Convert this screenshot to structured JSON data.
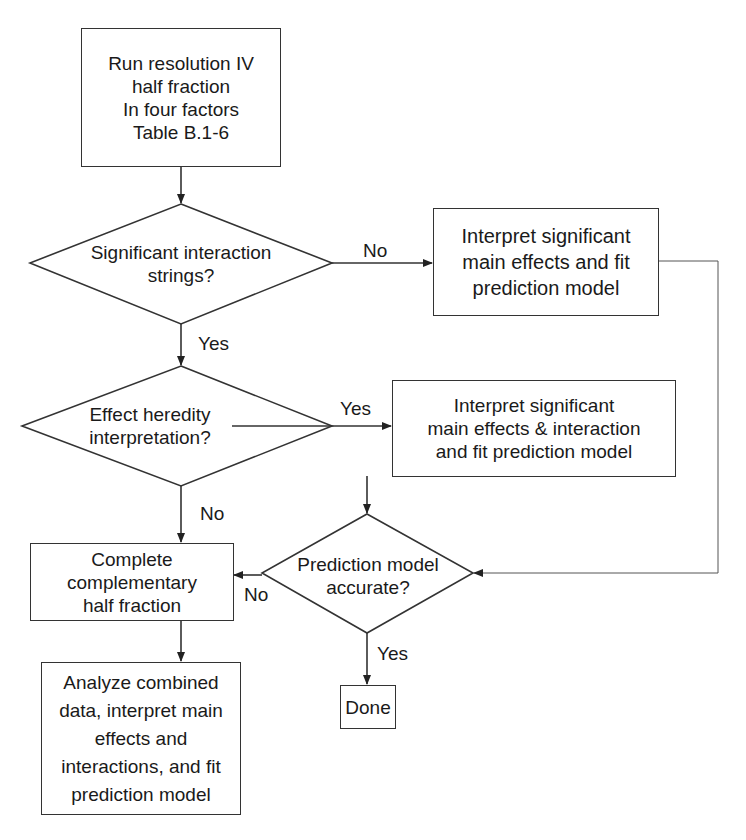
{
  "flowchart": {
    "nodes": {
      "start": {
        "type": "process",
        "text": "Run resolution IV\nhalf fraction\nIn four factors\nTable B.1-6"
      },
      "decision_interactions": {
        "type": "decision",
        "text": "Significant interaction\nstrings?"
      },
      "main_effects_model": {
        "type": "process",
        "text": "Interpret significant\nmain effects and fit\nprediction model"
      },
      "decision_heredity": {
        "type": "decision",
        "text": "Effect heredity\ninterpretation?"
      },
      "effects_interaction_model": {
        "type": "process",
        "text": "Interpret significant\nmain effects & interaction\nand fit prediction model"
      },
      "decision_accurate": {
        "type": "decision",
        "text": "Prediction model\naccurate?"
      },
      "complementary": {
        "type": "process",
        "text": "Complete complementary\nhalf fraction"
      },
      "analyze_combined": {
        "type": "process",
        "text": "Analyze combined\ndata, interpret main\neffects and\ninteractions, and fit\nprediction model"
      },
      "done": {
        "type": "terminal",
        "text": "Done"
      }
    },
    "edge_labels": {
      "interactions_no": "No",
      "interactions_yes": "Yes",
      "heredity_yes": "Yes",
      "heredity_no": "No",
      "accurate_no": "No",
      "accurate_yes": "Yes"
    },
    "edges": [
      {
        "from": "start",
        "to": "decision_interactions",
        "label": ""
      },
      {
        "from": "decision_interactions",
        "to": "main_effects_model",
        "label": "No"
      },
      {
        "from": "decision_interactions",
        "to": "decision_heredity",
        "label": "Yes"
      },
      {
        "from": "main_effects_model",
        "to": "decision_accurate",
        "label": ""
      },
      {
        "from": "decision_heredity",
        "to": "effects_interaction_model",
        "label": "Yes"
      },
      {
        "from": "decision_heredity",
        "to": "complementary",
        "label": "No"
      },
      {
        "from": "effects_interaction_model",
        "to": "decision_accurate",
        "label": ""
      },
      {
        "from": "decision_accurate",
        "to": "complementary",
        "label": "No"
      },
      {
        "from": "decision_accurate",
        "to": "done",
        "label": "Yes"
      },
      {
        "from": "complementary",
        "to": "analyze_combined",
        "label": ""
      }
    ],
    "colors": {
      "stroke": "#333333",
      "text": "#1a1a1a",
      "background": "#ffffff"
    }
  }
}
